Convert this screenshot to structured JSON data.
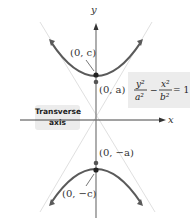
{
  "diagram": {
    "type": "hyperbola",
    "orientation": "vertical transverse axis",
    "axes": {
      "x_label": "x",
      "y_label": "y"
    },
    "equation": {
      "lhs_term1_num": "y²",
      "lhs_term1_den": "a²",
      "operator": "−",
      "lhs_term2_num": "x²",
      "lhs_term2_den": "b²",
      "rhs": "= 1"
    },
    "points": [
      {
        "label": "(0, c)",
        "role": "focus"
      },
      {
        "label": "(0, a)",
        "role": "vertex"
      },
      {
        "label": "(0, −a)",
        "role": "vertex"
      },
      {
        "label": "(0, −c)",
        "role": "focus"
      }
    ],
    "callout": {
      "line1": "Transverse",
      "line2": "axis"
    },
    "colors": {
      "curve": "#5a5a5a",
      "axis": "#7a7a7a",
      "point": "#222222",
      "box": "#ececec",
      "asymptote": "#dddddd"
    }
  }
}
